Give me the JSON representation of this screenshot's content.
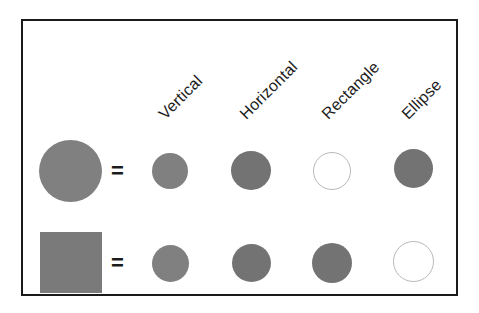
{
  "figure": {
    "border_color": "#1a1a1a",
    "background_color": "#ffffff",
    "fill_gray": "#808080",
    "outline_gray": "#b9b9b9",
    "equals_sign": "="
  },
  "columns": [
    {
      "label": "Vertical"
    },
    {
      "label": "Horizontal"
    },
    {
      "label": "Rectangle"
    },
    {
      "label": "Ellipse"
    }
  ],
  "rows": [
    {
      "reference": {
        "shape": "circle",
        "state": "filled"
      },
      "operator": "=",
      "cells": [
        {
          "shape": "circle",
          "state": "filled"
        },
        {
          "shape": "circle",
          "state": "filled"
        },
        {
          "shape": "circle",
          "state": "outline"
        },
        {
          "shape": "circle",
          "state": "filled"
        }
      ]
    },
    {
      "reference": {
        "shape": "square",
        "state": "filled"
      },
      "operator": "=",
      "cells": [
        {
          "shape": "circle",
          "state": "filled"
        },
        {
          "shape": "circle",
          "state": "filled"
        },
        {
          "shape": "circle",
          "state": "filled"
        },
        {
          "shape": "circle",
          "state": "outline"
        }
      ]
    }
  ]
}
